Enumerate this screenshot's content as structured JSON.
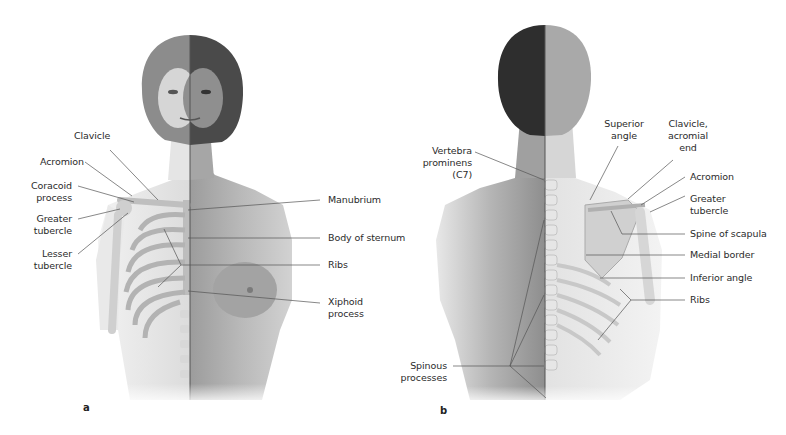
{
  "figure": {
    "panels": [
      {
        "letter": "a",
        "view": "anterior",
        "labels": {
          "clavicle": [
            "Clavicle"
          ],
          "acromion": [
            "Acromion"
          ],
          "coracoid": [
            "Coracoid",
            "process"
          ],
          "greater_tubercle": [
            "Greater",
            "tubercle"
          ],
          "lesser_tubercle": [
            "Lesser",
            "tubercle"
          ],
          "manubrium": [
            "Manubrium"
          ],
          "body_sternum": [
            "Body of sternum"
          ],
          "ribs": [
            "Ribs"
          ],
          "xiphoid": [
            "Xiphoid",
            "process"
          ]
        }
      },
      {
        "letter": "b",
        "view": "posterior",
        "labels": {
          "vertebra": [
            "Vertebra",
            "prominens",
            "(C7)"
          ],
          "superior_angle": [
            "Superior",
            "angle"
          ],
          "clavicle_acromial": [
            "Clavicle,",
            "acromial",
            "end"
          ],
          "acromion": [
            "Acromion"
          ],
          "greater_tubercle": [
            "Greater",
            "tubercle"
          ],
          "spine_scapula": [
            "Spine of scapula"
          ],
          "medial_border": [
            "Medial border"
          ],
          "inferior_angle": [
            "Inferior angle"
          ],
          "ribs": [
            "Ribs"
          ],
          "spinous": [
            "Spinous",
            "processes"
          ]
        }
      }
    ],
    "colors": {
      "label_text": "#2b2b2b",
      "leader_line": "#555555",
      "skin_light": "#e6e6e6",
      "skin_dark": "#a8a8a8",
      "bone": "#c9c9c9",
      "hair_dark": "#3a3a3a"
    }
  }
}
